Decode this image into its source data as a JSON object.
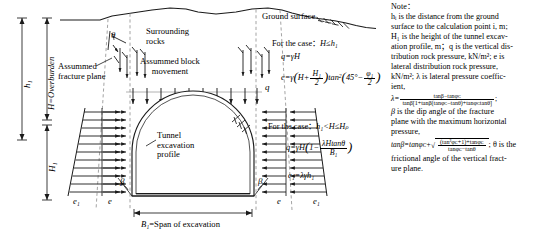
{
  "figure": {
    "type": "engineering-cross-section"
  },
  "diagram": {
    "ground_surface_label": "Ground surface",
    "surrounding_rocks_label": "Surrounding\nrocks",
    "surrounding_rocks_line1": "Surrounding",
    "surrounding_rocks_line2": "rocks",
    "assumed_block_line1": "Assummed block",
    "assumed_block_line2": "movement",
    "assumed_fracture_line1": "Assummed",
    "assumed_fracture_line2": "fracture plane",
    "tunnel_line1": "Tunnel",
    "tunnel_line2": "excavation",
    "tunnel_line3": "profile",
    "vertical_load_label": "q",
    "angle_theta": "θ",
    "angle_beta_left": "β",
    "angle_beta_right": "β",
    "lateral_e1_left": "e₁",
    "lateral_e_left": "e",
    "lateral_e_right": "e",
    "lateral_e1_right": "e₁",
    "span_label_prefix": "B₁",
    "span_label_suffix": "=Span of excavation",
    "dim_h1": "h₁",
    "dim_H": "H=Overburden",
    "dim_H1": "H₁"
  },
  "formulas": {
    "case1_header_prefix": "For the case：",
    "case1_condition": "H≤h₁",
    "case1_q_lhs": "q",
    "case1_q_rhs": "=γH",
    "case1_e_lhs": "e",
    "case1_e_eq": "=γ",
    "case1_e_inner_H": "H+",
    "case1_e_frac_num": "H₁",
    "case1_e_frac_den": "2",
    "case1_e_tan": "tan",
    "case1_e_tan_sup": "2",
    "case1_e_angle": "45°−",
    "case1_e_phi_num": "φ₁",
    "case1_e_phi_den": "2",
    "case2_header_prefix": "For the case：",
    "case2_condition": "h₁<H≤Hₚ",
    "case2_q_lhs": "q",
    "case2_q_eq": "=γH",
    "case2_q_inner_one": "1−",
    "case2_q_frac_num": "λHtanθ",
    "case2_q_frac_den": "B₁",
    "case3_e1": "e₁=λγh₁"
  },
  "note": {
    "title": "Note：",
    "lines": [
      "hᵢ is the distance from the ground",
      "surface to the calculation point i, m;",
      "H₁ is the height of the tunnel excav-",
      "ation profile, m；q is the vertical dis-",
      "tribution rock pressure, kN/m²; e is",
      "lateral distribution rock pressure,",
      "kN/m²; λ is lateral pressure coeffic-",
      "ient,"
    ],
    "lambda_lhs": "λ=",
    "lambda_num": "tanβ−tanφᴄ",
    "lambda_den": "tanβ[1+tanβ(tanφᴄ−tanθ)+tanφᴄtanθ]",
    "lambda_semicolon": ";",
    "beta_lines": [
      "β is the dip angle of the fracture",
      "plane with the maximum horizontal",
      "pressure,"
    ],
    "tanbeta_lhs": "tanβ=tanφᴄ+",
    "tanbeta_num": "(tan²φᴄ+1)+tanφᴄ",
    "tanbeta_den": "tanφᴄ−tanθ",
    "tanbeta_tail": "; θ is the",
    "theta_lines": [
      "frictional angle of the vertical fract-",
      "ure plane."
    ]
  },
  "colors": {
    "line": "#1a1a1a",
    "dashed": "#9a9a9a",
    "background": "#ffffff"
  }
}
